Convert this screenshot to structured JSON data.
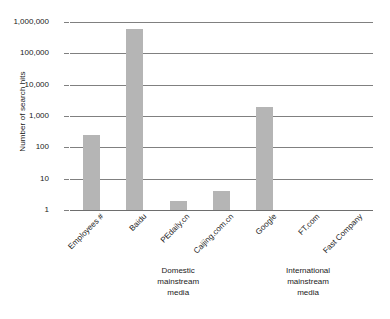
{
  "chart_data": {
    "type": "bar",
    "title": "",
    "xlabel": "",
    "ylabel": "Number of search hits",
    "yscale": "log",
    "ylim": [
      1,
      1000000
    ],
    "grid": true,
    "legend": "none",
    "ytick_labels": [
      "1,000,000",
      "100,000",
      "10,000",
      "1,000",
      "100",
      "10",
      "1"
    ],
    "ytick_values": [
      1000000,
      100000,
      10000,
      1000,
      100,
      10,
      1
    ],
    "categories": [
      "Employees #",
      "Baidu",
      "PEdaily.cn",
      "Caijing.com.cn",
      "Google",
      "FT.com",
      "Fast Company"
    ],
    "values": [
      250,
      600000,
      2,
      4,
      1900,
      0,
      0
    ],
    "bar_color": "#b5b5b5",
    "annotations": [
      {
        "id": "domestic",
        "lines": [
          "Domestic",
          "mainstream",
          "media"
        ],
        "covers": [
          "Baidu",
          "PEdaily.cn",
          "Caijing.com.cn"
        ]
      },
      {
        "id": "international",
        "lines": [
          "International",
          "mainstream",
          "media"
        ],
        "covers": [
          "Google",
          "FT.com",
          "Fast Company"
        ]
      }
    ]
  }
}
